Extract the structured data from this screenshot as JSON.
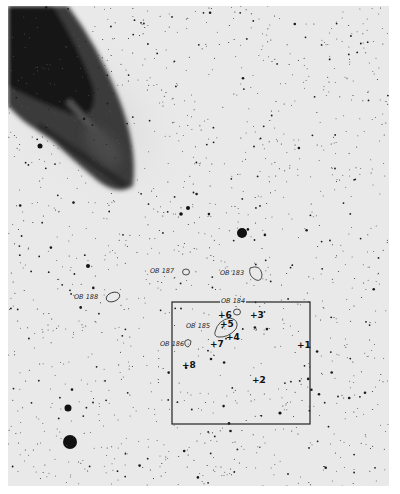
{
  "image": {
    "description": "Negative print of a galaxy field with annotated OB associations and numbered fields",
    "colors": {
      "background": "#e9e9e9",
      "ink": "#111111",
      "border": "#ffffff"
    }
  },
  "ob_labels": [
    {
      "id": "ob187",
      "text": "OB 187"
    },
    {
      "id": "ob183",
      "text": "OB 183"
    },
    {
      "id": "ob188",
      "text": "OB 188"
    },
    {
      "id": "ob184",
      "text": "OB 184"
    },
    {
      "id": "ob185",
      "text": "OB 185"
    },
    {
      "id": "ob186",
      "text": "OB 186"
    }
  ],
  "field_markers": [
    {
      "text": "+1"
    },
    {
      "text": "+2"
    },
    {
      "text": "+3"
    },
    {
      "text": "+4"
    },
    {
      "text": "+5"
    },
    {
      "text": "+6"
    },
    {
      "text": "+7"
    },
    {
      "text": "+8"
    }
  ]
}
